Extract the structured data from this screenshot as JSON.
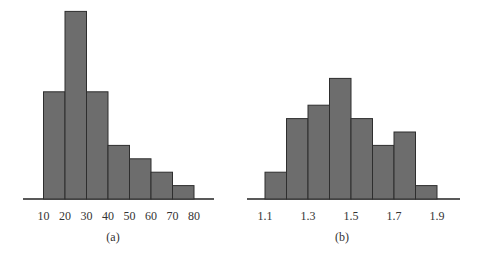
{
  "chart_data": [
    {
      "type": "bar",
      "title": "",
      "caption": "(a)",
      "xlabel": "",
      "ylabel": "",
      "bin_edges": [
        10,
        20,
        30,
        40,
        50,
        60,
        70,
        80
      ],
      "categories": [
        "10-20",
        "20-30",
        "30-40",
        "40-50",
        "50-60",
        "60-70",
        "70-80"
      ],
      "values": [
        8,
        14,
        8,
        4,
        3,
        2,
        1
      ],
      "tick_labels": [
        "10",
        "20",
        "30",
        "40",
        "50",
        "60",
        "70",
        "80"
      ],
      "ylim": [
        0,
        14
      ],
      "grid": false,
      "y_axis_shown": false,
      "colors": {
        "fill": "#6d6d6d",
        "stroke": "#2e2e2e"
      }
    },
    {
      "type": "bar",
      "title": "",
      "caption": "(b)",
      "xlabel": "",
      "ylabel": "",
      "bin_edges": [
        1.1,
        1.2,
        1.3,
        1.4,
        1.5,
        1.6,
        1.7,
        1.8,
        1.9
      ],
      "categories": [
        "1.1-1.2",
        "1.2-1.3",
        "1.3-1.4",
        "1.4-1.5",
        "1.5-1.6",
        "1.6-1.7",
        "1.7-1.8",
        "1.8-1.9"
      ],
      "values": [
        2,
        6,
        7,
        9,
        6,
        4,
        5,
        1
      ],
      "tick_labels": [
        "1.1",
        "1.3",
        "1.5",
        "1.7",
        "1.9"
      ],
      "ylim": [
        0,
        14
      ],
      "grid": false,
      "y_axis_shown": false,
      "colors": {
        "fill": "#6d6d6d",
        "stroke": "#2e2e2e"
      }
    }
  ]
}
